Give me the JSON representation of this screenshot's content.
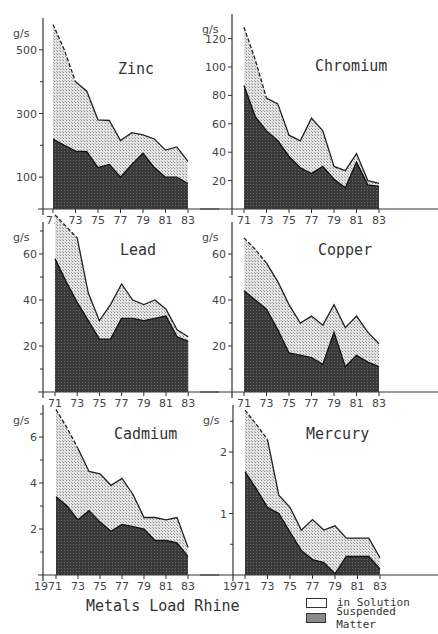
{
  "figure": {
    "title": "Metals Load Rhine",
    "legend": [
      {
        "label": "in Solution",
        "swatch": "white"
      },
      {
        "label": "Suspended Matter",
        "swatch": "dark"
      }
    ],
    "colors": {
      "suspended": "#3a3a3a",
      "in_solution": "#c8c8c8",
      "axis": "#333333"
    }
  },
  "chart_data": [
    {
      "type": "area",
      "title": "Zinc",
      "ylabel": "g/s",
      "xlabel": "",
      "x": [
        1971,
        1972,
        1973,
        1974,
        1975,
        1976,
        1977,
        1978,
        1979,
        1980,
        1981,
        1982,
        1983
      ],
      "x_tick_labels": [
        "71",
        "73",
        "75",
        "77",
        "79",
        "81",
        "83"
      ],
      "y_ticks": [
        100,
        300,
        500
      ],
      "ylim": [
        0,
        600
      ],
      "series": [
        {
          "name": "Total (in Solution + Suspended Matter)",
          "values": [
            580,
            500,
            400,
            370,
            280,
            278,
            215,
            240,
            233,
            220,
            185,
            195,
            150
          ]
        },
        {
          "name": "Suspended Matter",
          "values": [
            220,
            200,
            182,
            180,
            130,
            140,
            100,
            140,
            175,
            130,
            100,
            100,
            80
          ]
        }
      ]
    },
    {
      "type": "area",
      "title": "Chromium",
      "ylabel": "g/s",
      "xlabel": "",
      "x": [
        1971,
        1972,
        1973,
        1974,
        1975,
        1976,
        1977,
        1978,
        1979,
        1980,
        1981,
        1982,
        1983
      ],
      "x_tick_labels": [
        "71",
        "73",
        "75",
        "77",
        "79",
        "81",
        "83"
      ],
      "y_ticks": [
        20,
        40,
        60,
        80,
        100,
        120
      ],
      "ylim": [
        0,
        130
      ],
      "series": [
        {
          "name": "Total (in Solution + Suspended Matter)",
          "values": [
            128,
            105,
            78,
            74,
            52,
            48,
            64,
            55,
            30,
            27,
            39,
            20,
            18
          ]
        },
        {
          "name": "Suspended Matter",
          "values": [
            87,
            65,
            55,
            48,
            37,
            29,
            25,
            30,
            21,
            15,
            33,
            17,
            16
          ]
        }
      ]
    },
    {
      "type": "area",
      "title": "Lead",
      "ylabel": "g/s",
      "xlabel": "",
      "x": [
        1971,
        1972,
        1973,
        1974,
        1975,
        1976,
        1977,
        1978,
        1979,
        1980,
        1981,
        1982,
        1983
      ],
      "x_tick_labels": [
        "71",
        "73",
        "75",
        "77",
        "79",
        "81",
        "83"
      ],
      "y_ticks": [
        20,
        40,
        60
      ],
      "ylim": [
        0,
        80
      ],
      "series": [
        {
          "name": "Total (in Solution + Suspended Matter)",
          "values": [
            77,
            72,
            67,
            43,
            31,
            38,
            47,
            40,
            38,
            40,
            36,
            27,
            24
          ]
        },
        {
          "name": "Suspended Matter",
          "values": [
            58,
            48,
            39,
            31,
            23,
            23,
            32,
            32,
            31,
            32,
            33,
            24,
            22
          ]
        }
      ]
    },
    {
      "type": "area",
      "title": "Copper",
      "ylabel": "g/s",
      "xlabel": "",
      "x": [
        1971,
        1972,
        1973,
        1974,
        1975,
        1976,
        1977,
        1978,
        1979,
        1980,
        1981,
        1982,
        1983
      ],
      "x_tick_labels": [
        "71",
        "73",
        "75",
        "77",
        "79",
        "81",
        "83"
      ],
      "y_ticks": [
        20,
        40,
        60
      ],
      "ylim": [
        0,
        70
      ],
      "series": [
        {
          "name": "Total (in Solution + Suspended Matter)",
          "values": [
            67,
            62,
            56,
            48,
            38,
            30,
            33,
            29,
            38,
            28,
            33,
            26,
            21
          ]
        },
        {
          "name": "Suspended Matter",
          "values": [
            44,
            40,
            36,
            27,
            17,
            16,
            15,
            12,
            26,
            11,
            16,
            13,
            11
          ]
        }
      ]
    },
    {
      "type": "area",
      "title": "Cadmium",
      "ylabel": "g/s",
      "xlabel": "",
      "x": [
        1971,
        1972,
        1973,
        1974,
        1975,
        1976,
        1977,
        1978,
        1979,
        1980,
        1981,
        1982,
        1983
      ],
      "x_tick_labels": [
        "1971",
        "73",
        "75",
        "77",
        "79",
        "81",
        "83"
      ],
      "y_ticks": [
        2,
        4,
        6
      ],
      "ylim": [
        0,
        7.5
      ],
      "series": [
        {
          "name": "Total (in Solution + Suspended Matter)",
          "values": [
            7.2,
            6.4,
            5.5,
            4.5,
            4.4,
            3.9,
            4.2,
            3.5,
            2.5,
            2.5,
            2.4,
            2.5,
            1.2
          ]
        },
        {
          "name": "Suspended Matter",
          "values": [
            3.4,
            3.0,
            2.4,
            2.8,
            2.3,
            1.9,
            2.2,
            2.1,
            2.0,
            1.5,
            1.5,
            1.4,
            0.8
          ]
        }
      ]
    },
    {
      "type": "area",
      "title": "Mercury",
      "ylabel": "g/s",
      "xlabel": "",
      "x": [
        1971,
        1972,
        1973,
        1974,
        1975,
        1976,
        1977,
        1978,
        1979,
        1980,
        1981,
        1982,
        1983
      ],
      "x_tick_labels": [
        "1971",
        "73",
        "75",
        "77",
        "79",
        "81",
        "83"
      ],
      "y_ticks": [
        1,
        2
      ],
      "ylim": [
        0,
        2.8
      ],
      "series": [
        {
          "name": "Total (in Solution + Suspended Matter)",
          "values": [
            2.68,
            2.45,
            2.2,
            1.3,
            1.1,
            0.73,
            0.9,
            0.73,
            0.8,
            0.6,
            0.6,
            0.6,
            0.28
          ]
        },
        {
          "name": "Suspended Matter",
          "values": [
            1.68,
            1.4,
            1.1,
            1.0,
            0.7,
            0.4,
            0.25,
            0.2,
            0.02,
            0.3,
            0.3,
            0.3,
            0.1
          ]
        }
      ]
    }
  ],
  "layout": {
    "panels": [
      {
        "axis_x": 43,
        "x71": 53,
        "year_px": 11.25,
        "baseline": 209,
        "top_px": 18,
        "unit_px_per": 0.3183,
        "title_x": 118,
        "title_y": 74,
        "minor_ticks": [
          200,
          400
        ],
        "first_label_offset": 0
      },
      {
        "axis_x": 232,
        "x71": 244,
        "year_px": 11.25,
        "baseline": 209,
        "top_px": 14,
        "unit_px_per": 1.42,
        "title_x": 315,
        "title_y": 71,
        "minor_ticks": [],
        "first_label_offset": 0
      },
      {
        "axis_x": 43,
        "x71": 55,
        "year_px": 11.1,
        "baseline": 392,
        "top_px": 222,
        "unit_px_per": 2.3,
        "title_x": 120,
        "title_y": 255,
        "minor_ticks": [
          10,
          30,
          50,
          70
        ],
        "first_label_offset": 0
      },
      {
        "axis_x": 232,
        "x71": 244,
        "year_px": 11.25,
        "baseline": 392,
        "top_px": 222,
        "unit_px_per": 2.3,
        "title_x": 318,
        "title_y": 255,
        "minor_ticks": [
          10,
          30,
          50
        ],
        "first_label_offset": 0
      },
      {
        "axis_x": 43,
        "x71": 56,
        "year_px": 11.0,
        "baseline": 575,
        "top_px": 405,
        "unit_px_per": 23.0,
        "title_x": 114,
        "title_y": 439,
        "minor_ticks": [
          1,
          3,
          5,
          7
        ],
        "first_label_offset": -8
      },
      {
        "axis_x": 233,
        "x71": 245,
        "year_px": 11.25,
        "baseline": 575,
        "top_px": 405,
        "unit_px_per": 61.5,
        "title_x": 306,
        "title_y": 439,
        "minor_ticks": [
          0.5,
          1.5,
          2.5
        ],
        "first_label_offset": -8
      }
    ]
  }
}
